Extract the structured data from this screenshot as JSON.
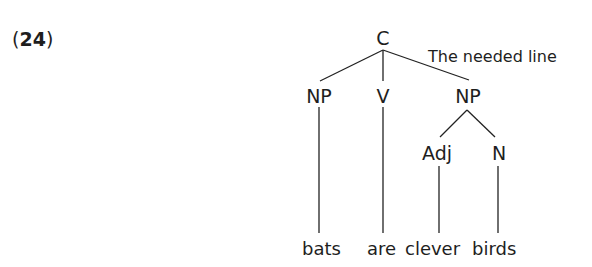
{
  "example": {
    "open_paren": "(",
    "number": "24",
    "close_paren": ")"
  },
  "tree": {
    "root": "C",
    "annotation": "The needed line",
    "nodes": {
      "np_subject": "NP",
      "verb": "V",
      "np_object": "NP",
      "adj": "Adj",
      "noun": "N"
    },
    "words": [
      "bats",
      "are",
      "clever",
      "birds"
    ]
  },
  "colors": {
    "text": "#1e1e1e",
    "background": "#ffffff"
  }
}
